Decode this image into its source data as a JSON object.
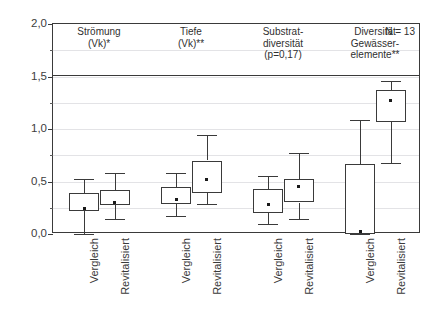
{
  "top_sliver": "",
  "chart_data": {
    "type": "box",
    "title": "",
    "xlabel": "",
    "ylabel": "",
    "ylim": [
      0.0,
      2.0
    ],
    "ytick_labels": [
      "0,0",
      "0,5",
      "1,0",
      "1,5",
      "2,0"
    ],
    "ytick_values": [
      0.0,
      0.5,
      1.0,
      1.5,
      2.0
    ],
    "yminor_step": 0.25,
    "grid": true,
    "legend": "none",
    "n_label": "N = 13",
    "groups": [
      {
        "title": "Strömung\n(Vk)*",
        "title_lines": [
          "Strömung",
          "(Vk)*"
        ]
      },
      {
        "title": "Tiefe\n(Vk)**",
        "title_lines": [
          "Tiefe",
          "(Vk)**"
        ]
      },
      {
        "title": "Substrat-\ndiversität\n(p=0,17)",
        "title_lines": [
          "Substrat-",
          "diversität",
          "(p=0,17)"
        ]
      },
      {
        "title": "Diversität\nGewässer-\nelemente**",
        "title_lines": [
          "Diversität",
          "Gewässer-",
          "elemente**"
        ]
      }
    ],
    "categories": [
      "Vergleich",
      "Revitalisiert",
      "Vergleich",
      "Revitalisiert",
      "Vergleich",
      "Revitalisiert",
      "Vergleich",
      "Revitalisiert"
    ],
    "boxes": [
      {
        "label": "Vergleich",
        "group": "Strömung (Vk)*",
        "min": 0.0,
        "q1": 0.22,
        "median": 0.24,
        "q3": 0.39,
        "max": 0.52
      },
      {
        "label": "Revitalisiert",
        "group": "Strömung (Vk)*",
        "min": 0.14,
        "q1": 0.28,
        "median": 0.3,
        "q3": 0.42,
        "max": 0.58
      },
      {
        "label": "Vergleich",
        "group": "Tiefe (Vk)**",
        "min": 0.17,
        "q1": 0.29,
        "median": 0.33,
        "q3": 0.45,
        "max": 0.58
      },
      {
        "label": "Revitalisiert",
        "group": "Tiefe (Vk)**",
        "min": 0.29,
        "q1": 0.39,
        "median": 0.52,
        "q3": 0.7,
        "max": 0.94
      },
      {
        "label": "Vergleich",
        "group": "Substratdiversität (p=0,17)",
        "min": 0.1,
        "q1": 0.2,
        "median": 0.28,
        "q3": 0.43,
        "max": 0.55
      },
      {
        "label": "Revitalisiert",
        "group": "Substratdiversität (p=0,17)",
        "min": 0.14,
        "q1": 0.3,
        "median": 0.45,
        "q3": 0.52,
        "max": 0.77
      },
      {
        "label": "Vergleich",
        "group": "Diversität Gewässerelemente**",
        "min": 0.0,
        "q1": 0.0,
        "median": 0.02,
        "q3": 0.67,
        "max": 1.09
      },
      {
        "label": "Revitalisiert",
        "group": "Diversität Gewässerelemente**",
        "min": 0.68,
        "q1": 1.07,
        "median": 1.27,
        "q3": 1.37,
        "max": 1.46
      }
    ],
    "colors": {
      "frame": "#3a3a3a",
      "grid": "#e3e3e6",
      "box_fill": "#ffffff",
      "box_stroke": "#3a3a3a",
      "text": "#303030",
      "background": "#ffffff"
    }
  }
}
